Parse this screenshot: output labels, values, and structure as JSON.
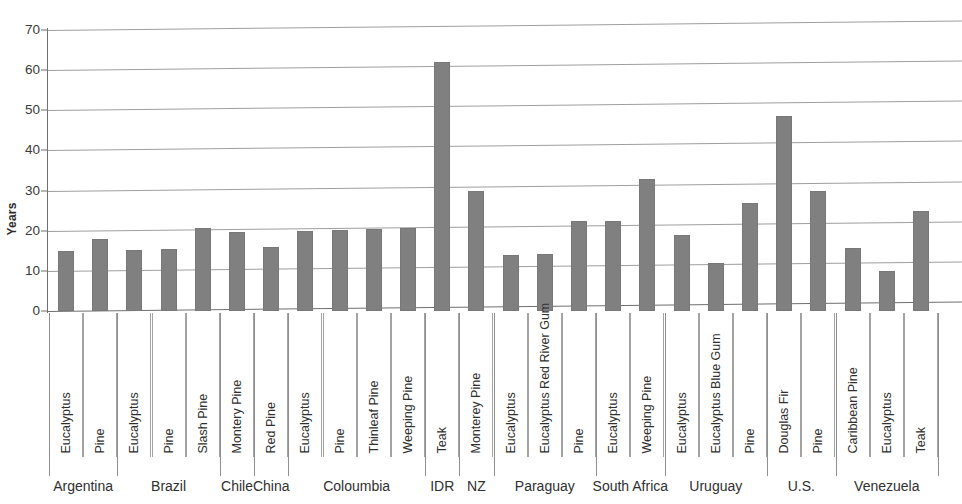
{
  "chart_data": {
    "type": "bar",
    "title": "",
    "xlabel": "",
    "ylabel": "Years",
    "ylim": [
      0,
      70
    ],
    "ytick_values": [
      0,
      10,
      20,
      30,
      40,
      50,
      60,
      70
    ],
    "ytick_labels": [
      "0",
      "10",
      "20",
      "30",
      "40",
      "50",
      "60",
      "70"
    ],
    "grid": true,
    "legend": "none",
    "bar_color": "#808080",
    "categories": [
      "Eucalyptus",
      "Pine",
      "Eucalyptus",
      "Pine",
      "Slash Pine",
      "Montery Pine",
      "Red Pine",
      "Eucalyptus",
      "Pine",
      "Thinleaf Pine",
      "Weeping Pine",
      "Teak",
      "Monterey Pine",
      "Eucalyptus",
      "Eucalyptus Red River Gum",
      "Pine",
      "Eucalyptus",
      "Weeping Pine",
      "Eucalyptus",
      "Eucalyptus Blue Gum",
      "Pine",
      "Douglas Fir",
      "Pine",
      "Caribbean Pine",
      "Eucalyptus",
      "Teak"
    ],
    "values": [
      15,
      18,
      15.3,
      15.4,
      20.8,
      19.7,
      15.9,
      20,
      20.2,
      20.5,
      20.7,
      62,
      30,
      14,
      14.2,
      22.5,
      22.5,
      33,
      19,
      12,
      27,
      48.5,
      30,
      15.8,
      10,
      25
    ],
    "groups": [
      {
        "label": "Argentina",
        "count": 2
      },
      {
        "label": "Brazil",
        "count": 3
      },
      {
        "label": "Chile",
        "count": 1
      },
      {
        "label": "China",
        "count": 1
      },
      {
        "label": "Coloumbia",
        "count": 4
      },
      {
        "label": "IDR",
        "count": 1
      },
      {
        "label": "NZ",
        "count": 1
      },
      {
        "label": "Paraguay",
        "count": 3
      },
      {
        "label": "South Africa",
        "count": 2
      },
      {
        "label": "Uruguay",
        "count": 3
      },
      {
        "label": "U.S.",
        "count": 2
      },
      {
        "label": "Venezuela",
        "count": 3
      }
    ]
  },
  "axis": {
    "y_title": "Years"
  }
}
